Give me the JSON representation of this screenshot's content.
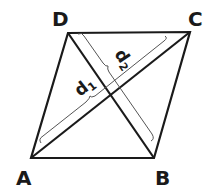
{
  "diagram": {
    "type": "rhombus",
    "vertices": [
      {
        "name": "A",
        "x": 31,
        "y": 158
      },
      {
        "name": "B",
        "x": 154,
        "y": 158
      },
      {
        "name": "C",
        "x": 190,
        "y": 32
      },
      {
        "name": "D",
        "x": 68,
        "y": 33
      }
    ],
    "diagonals": [
      {
        "name": "d",
        "sub": "1",
        "from": "A",
        "to": "C"
      },
      {
        "name": "d",
        "sub": "2",
        "from": "D",
        "to": "B"
      }
    ],
    "colors": {
      "stroke": "#1a1a1a",
      "bracket": "#555555",
      "background": "#ffffff"
    }
  }
}
